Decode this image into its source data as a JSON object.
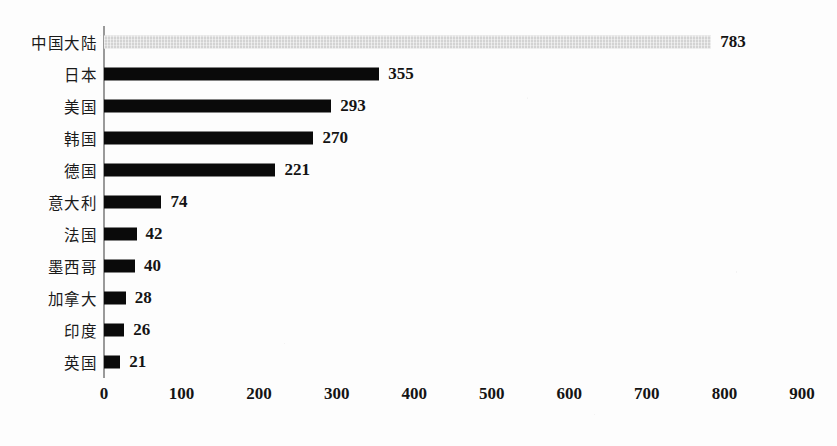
{
  "chart_data": {
    "type": "bar",
    "orientation": "horizontal",
    "title": "",
    "subtitle": "",
    "xlabel": "",
    "ylabel": "",
    "xlim": [
      0,
      900
    ],
    "xticks": [
      0,
      100,
      200,
      300,
      400,
      500,
      600,
      700,
      800,
      900
    ],
    "xtick_labels": [
      "0",
      "100",
      "200",
      "300",
      "400",
      "500",
      "600",
      "700",
      "800",
      "900"
    ],
    "grid": false,
    "legend": null,
    "categories": [
      "中国大陆",
      "日本",
      "美国",
      "韩国",
      "德国",
      "意大利",
      "法国",
      "墨西哥",
      "加拿大",
      "印度",
      "英国"
    ],
    "values": [
      783,
      355,
      293,
      270,
      221,
      74,
      42,
      40,
      28,
      26,
      21
    ],
    "value_labels": [
      "783",
      "355",
      "293",
      "270",
      "221",
      "74",
      "42",
      "40",
      "28",
      "26",
      "21"
    ],
    "bar_colors": [
      "#d3d3d3",
      "#0a0a0a",
      "#0a0a0a",
      "#0a0a0a",
      "#0a0a0a",
      "#0a0a0a",
      "#0a0a0a",
      "#0a0a0a",
      "#0a0a0a",
      "#0a0a0a",
      "#0a0a0a"
    ],
    "highlight_index": 0,
    "axis_color": "#9a9a9a",
    "background_color": "#fdfdfd"
  },
  "rows": [
    {
      "label": "中国大陆",
      "value_label": "783"
    },
    {
      "label": "日本",
      "value_label": "355"
    },
    {
      "label": "美国",
      "value_label": "293"
    },
    {
      "label": "韩国",
      "value_label": "270"
    },
    {
      "label": "德国",
      "value_label": "221"
    },
    {
      "label": "意大利",
      "value_label": "74"
    },
    {
      "label": "法国",
      "value_label": "42"
    },
    {
      "label": "墨西哥",
      "value_label": "40"
    },
    {
      "label": "加拿大",
      "value_label": "28"
    },
    {
      "label": "印度",
      "value_label": "26"
    },
    {
      "label": "英国",
      "value_label": "21"
    }
  ],
  "xaxis": {
    "ticks": [
      "0",
      "100",
      "200",
      "300",
      "400",
      "500",
      "600",
      "700",
      "800",
      "900"
    ]
  }
}
